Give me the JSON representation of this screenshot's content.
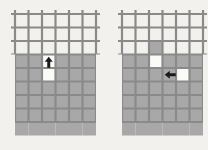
{
  "figure": {
    "title": "",
    "background_color": "#f2f1ee",
    "panel_count": 2
  },
  "style": {
    "grid_line_color": "#8a8a8a",
    "grid_line_width": 2.2,
    "shaded_cell_color": "#a8a8a8",
    "empty_cell_color": "#fbfaf7",
    "arrow_color": "#1a1a1a",
    "cell_size": 13.5
  },
  "panels": [
    {
      "name": "panel-left",
      "origin_x": 15,
      "origin_y": 14,
      "columns": 6,
      "rows": 8,
      "line_overhang": 4,
      "shaded_cells": [
        [
          3,
          0
        ],
        [
          3,
          1
        ],
        [
          3,
          3
        ],
        [
          3,
          4
        ],
        [
          3,
          5
        ],
        [
          4,
          0
        ],
        [
          4,
          1
        ],
        [
          4,
          3
        ],
        [
          4,
          4
        ],
        [
          4,
          5
        ],
        [
          5,
          0
        ],
        [
          5,
          1
        ],
        [
          5,
          2
        ],
        [
          5,
          3
        ],
        [
          5,
          4
        ],
        [
          5,
          5
        ],
        [
          6,
          0
        ],
        [
          6,
          1
        ],
        [
          6,
          2
        ],
        [
          6,
          3
        ],
        [
          6,
          4
        ],
        [
          6,
          5
        ],
        [
          7,
          0
        ],
        [
          7,
          1
        ],
        [
          7,
          2
        ],
        [
          7,
          3
        ],
        [
          7,
          4
        ],
        [
          7,
          5
        ],
        [
          8,
          0
        ],
        [
          8,
          1
        ],
        [
          8,
          2
        ],
        [
          8,
          3
        ],
        [
          8,
          4
        ],
        [
          8,
          5
        ]
      ],
      "empty_notch_cells": [
        [
          3,
          2
        ],
        [
          4,
          2
        ]
      ],
      "arrow": {
        "name": "move-arrow-up",
        "direction": "up",
        "cell_row": 3,
        "cell_col": 2,
        "label": ""
      }
    },
    {
      "name": "panel-right",
      "origin_x": 122,
      "origin_y": 14,
      "columns": 6,
      "rows": 8,
      "line_overhang": 4,
      "shaded_cells": [
        [
          2,
          2
        ],
        [
          3,
          0
        ],
        [
          3,
          1
        ],
        [
          3,
          3
        ],
        [
          3,
          4
        ],
        [
          3,
          5
        ],
        [
          4,
          0
        ],
        [
          4,
          1
        ],
        [
          4,
          2
        ],
        [
          4,
          3
        ],
        [
          4,
          5
        ],
        [
          5,
          0
        ],
        [
          5,
          1
        ],
        [
          5,
          2
        ],
        [
          5,
          3
        ],
        [
          5,
          4
        ],
        [
          5,
          5
        ],
        [
          6,
          0
        ],
        [
          6,
          1
        ],
        [
          6,
          2
        ],
        [
          6,
          3
        ],
        [
          6,
          4
        ],
        [
          6,
          5
        ],
        [
          7,
          0
        ],
        [
          7,
          1
        ],
        [
          7,
          2
        ],
        [
          7,
          3
        ],
        [
          7,
          4
        ],
        [
          7,
          5
        ],
        [
          8,
          0
        ],
        [
          8,
          1
        ],
        [
          8,
          2
        ],
        [
          8,
          3
        ],
        [
          8,
          4
        ],
        [
          8,
          5
        ]
      ],
      "empty_notch_cells": [
        [
          3,
          2
        ],
        [
          4,
          4
        ]
      ],
      "arrow": {
        "name": "move-arrow-left",
        "direction": "left",
        "cell_row": 4,
        "cell_col": 3,
        "label": ""
      }
    }
  ]
}
